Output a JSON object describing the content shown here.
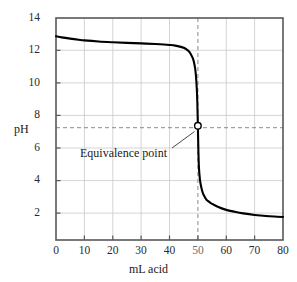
{
  "chart_data": {
    "type": "line",
    "title": "",
    "xlabel": "mL acid",
    "ylabel": "pH",
    "xlim": [
      0,
      80
    ],
    "ylim": [
      0,
      14
    ],
    "grid": true,
    "legend_position": "none",
    "x_ticks": [
      "0",
      "10",
      "20",
      "30",
      "40",
      "50",
      "60",
      "70",
      "80"
    ],
    "x_tick_values": [
      0,
      10,
      20,
      30,
      40,
      50,
      60,
      70,
      80
    ],
    "y_ticks": [
      "2",
      "4",
      "6",
      "8",
      "10",
      "12",
      "14"
    ],
    "y_tick_values": [
      2,
      4,
      6,
      8,
      10,
      12,
      14
    ],
    "series": [
      {
        "name": "titration curve",
        "x": [
          0,
          2,
          5,
          8,
          10,
          15,
          20,
          25,
          30,
          35,
          38,
          40,
          42,
          44,
          45,
          46,
          47,
          48,
          48.5,
          49,
          49.3,
          49.6,
          49.8,
          50,
          50.2,
          50.4,
          50.7,
          51,
          51.5,
          52,
          53,
          54,
          55,
          57,
          60,
          63,
          66,
          70,
          74,
          78,
          80
        ],
        "y": [
          12.85,
          12.78,
          12.7,
          12.63,
          12.59,
          12.52,
          12.47,
          12.43,
          12.4,
          12.36,
          12.33,
          12.3,
          12.26,
          12.18,
          12.12,
          12.02,
          11.86,
          11.55,
          11.3,
          10.85,
          10.4,
          9.6,
          8.7,
          7.2,
          5.5,
          4.5,
          3.85,
          3.5,
          3.1,
          2.85,
          2.55,
          2.4,
          2.28,
          2.1,
          1.9,
          1.78,
          1.68,
          1.58,
          1.51,
          1.47,
          1.45
        ]
      }
    ],
    "annotations": [
      {
        "label": "Equivalence point",
        "marker": "open-circle",
        "x": 50,
        "y": 7.2,
        "guide_lines": [
          "vertical-dashed-at-x-50",
          "horizontal-dashed-at-pH-7.2"
        ]
      }
    ],
    "colors": {
      "curve": "#000000",
      "grid": "#c8c8c8",
      "axis": "#5a5a5a",
      "guide": "#8a8a8a",
      "marker_fill": "#ffffff",
      "marker_stroke": "#000000",
      "text": "#1a1a1a",
      "background": "#ffffff"
    }
  }
}
